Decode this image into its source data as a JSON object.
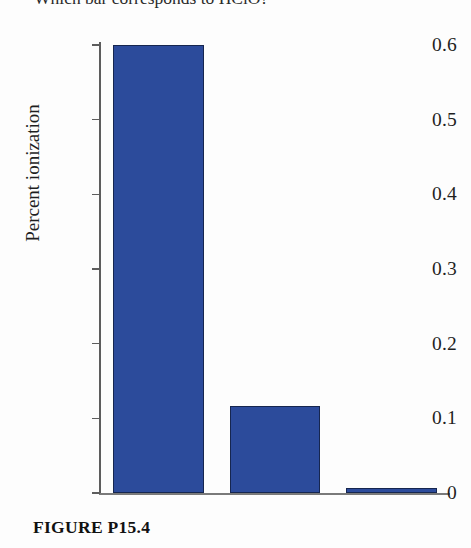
{
  "question": {
    "text": "Which bar corresponds to HClO?"
  },
  "caption": {
    "text": "FIGURE P15.4"
  },
  "axis": {
    "y_title": "Percent ionization",
    "tick_labels": [
      "0.6",
      "0.5",
      "0.4",
      "0.3",
      "0.2",
      "0.1",
      "0"
    ]
  },
  "colors": {
    "bar_fill": "#2c4b9b",
    "bar_stroke": "#16264f",
    "axis": "#5d5d5d",
    "background": "#fdfdfd",
    "text": "#1f1f1f"
  },
  "chart_data": {
    "type": "bar",
    "title": "",
    "subtitle": "",
    "xlabel": "",
    "ylabel": "Percent ionization",
    "categories": [
      "1",
      "2",
      "3"
    ],
    "values": [
      0.6,
      0.117,
      0.007
    ],
    "ylim": [
      0,
      0.6
    ],
    "yticks": [
      0,
      0.1,
      0.2,
      0.3,
      0.4,
      0.5,
      0.6
    ],
    "ytick_labels": [
      "0",
      "0.1",
      "0.2",
      "0.3",
      "0.4",
      "0.5",
      "0.6"
    ],
    "xticks": [],
    "xtick_labels": [],
    "grid": false,
    "legend": false,
    "legend_position": "none",
    "bar_color": "#2c4b9b",
    "annotations": []
  }
}
